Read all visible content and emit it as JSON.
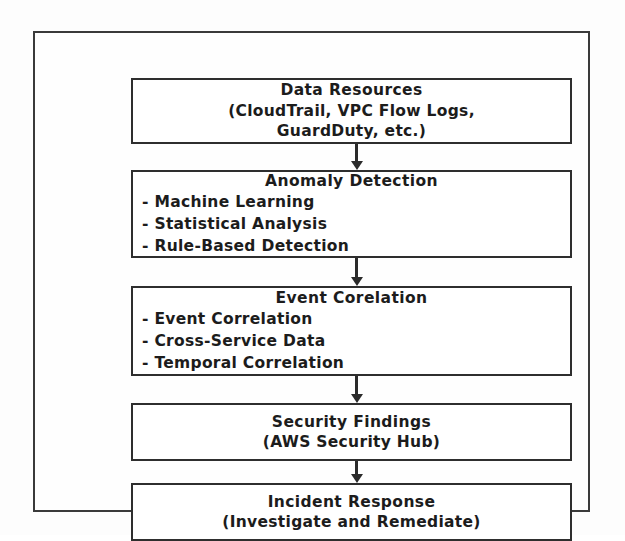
{
  "diagram": {
    "orientation": "vertical-top-down",
    "frame_color": "#3a3a3a",
    "box_border_color": "#2e2e2e",
    "text_color": "#1c1c1c",
    "arrow_color": "#2b2b2b",
    "background_color": "#fdfdfd",
    "nodes": [
      {
        "id": "data-resources",
        "title": "Data Resources",
        "subtitle_lines": [
          "(CloudTrail, VPC Flow Logs,",
          "GuardDuty, etc.)"
        ],
        "bullets": []
      },
      {
        "id": "anomaly-detection",
        "title": "Anomaly Detection",
        "subtitle_lines": [],
        "bullets": [
          "- Machine Learning",
          "- Statistical Analysis",
          "- Rule-Based Detection"
        ]
      },
      {
        "id": "event-corelation",
        "title": "Event Corelation",
        "subtitle_lines": [],
        "bullets": [
          "- Event Correlation",
          "- Cross-Service Data",
          "- Temporal Correlation"
        ]
      },
      {
        "id": "security-findings",
        "title": "Security Findings",
        "subtitle_lines": [
          "(AWS Security Hub)"
        ],
        "bullets": []
      },
      {
        "id": "incident-response",
        "title": "Incident Response",
        "subtitle_lines": [
          "(Investigate and Remediate)"
        ],
        "bullets": []
      }
    ],
    "connectors": [
      {
        "id": "connector-1",
        "from": "data-resources",
        "to": "anomaly-detection",
        "icon": "down-arrow-icon"
      },
      {
        "id": "connector-2",
        "from": "anomaly-detection",
        "to": "event-corelation",
        "icon": "down-arrow-icon"
      },
      {
        "id": "connector-3",
        "from": "event-corelation",
        "to": "security-findings",
        "icon": "down-arrow-icon"
      },
      {
        "id": "connector-4",
        "from": "security-findings",
        "to": "incident-response",
        "icon": "down-arrow-icon"
      }
    ]
  }
}
